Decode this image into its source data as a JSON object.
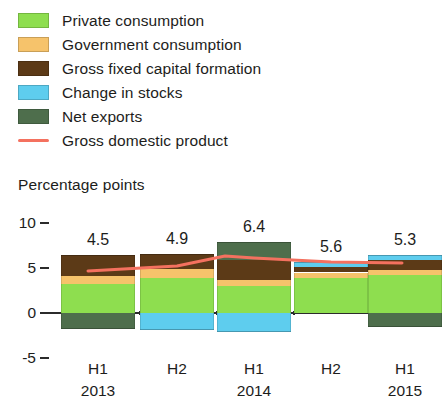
{
  "legend": {
    "items": [
      {
        "label": "Private consumption",
        "color": "#8ede4f",
        "marker": "swatch",
        "name": "private-consumption"
      },
      {
        "label": "Government consumption",
        "color": "#f6c36b",
        "marker": "swatch",
        "name": "government-consumption"
      },
      {
        "label": "Gross fixed capital formation",
        "color": "#5c3a17",
        "marker": "swatch",
        "name": "gross-fixed-capital-formation"
      },
      {
        "label": "Change in stocks",
        "color": "#5ecdee",
        "marker": "swatch",
        "name": "change-in-stocks"
      },
      {
        "label": "Net exports",
        "color": "#4e6e4c",
        "marker": "swatch",
        "name": "net-exports"
      },
      {
        "label": "Gross domestic product",
        "color": "#f4715f",
        "marker": "line",
        "name": "gross-domestic-product"
      }
    ]
  },
  "axis": {
    "y_title": "Percentage points",
    "y_ticks": [
      "10",
      "5",
      "0",
      "-5"
    ],
    "y_tick_values": [
      10,
      5,
      0,
      -5
    ],
    "ylim": [
      -5,
      10
    ]
  },
  "chart_data": {
    "type": "bar",
    "title": "",
    "subtitle": "",
    "xlabel": "",
    "ylabel": "Percentage points",
    "ylim": [
      -5,
      10
    ],
    "grid": false,
    "stacked": true,
    "legend_position": "top-left",
    "categories": [
      "H1",
      "H2",
      "H1",
      "H2",
      "H1"
    ],
    "category_years": [
      "2013",
      "2013",
      "2014",
      "2014",
      "2015"
    ],
    "year_labels": [
      "2013",
      "",
      "2014",
      "",
      "2015"
    ],
    "series": [
      {
        "name": "Private consumption",
        "color": "#8ede4f",
        "values": [
          3.2,
          3.9,
          3.0,
          3.9,
          4.2
        ]
      },
      {
        "name": "Government consumption",
        "color": "#f6c36b",
        "values": [
          0.9,
          1.0,
          0.7,
          0.6,
          0.6
        ]
      },
      {
        "name": "Gross fixed capital formation",
        "color": "#5c3a17",
        "values": [
          2.3,
          1.7,
          2.2,
          0.6,
          1.1
        ]
      },
      {
        "name": "Change in stocks",
        "color": "#5ecdee",
        "values": [
          0.0,
          -1.9,
          -2.1,
          0.6,
          0.6
        ]
      },
      {
        "name": "Net exports",
        "color": "#4e6e4c",
        "values": [
          -1.8,
          0.0,
          2.0,
          0.0,
          -1.6
        ]
      }
    ],
    "line_series": {
      "name": "Gross domestic product",
      "color": "#f4715f",
      "values": [
        4.5,
        4.9,
        6.4,
        5.6,
        5.3
      ]
    },
    "data_labels": [
      "4.5",
      "4.9",
      "6.4",
      "5.6",
      "5.3"
    ]
  }
}
